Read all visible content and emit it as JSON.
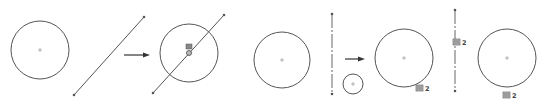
{
  "diagram": {
    "colors": {
      "stroke": "#555555",
      "background": "#ffffff",
      "arrow": "#333333",
      "icon": "#666666"
    },
    "panels": [
      {
        "id": "left-before",
        "elements": [
          {
            "type": "circle",
            "cx": 40,
            "cy": 50,
            "r": 29
          },
          {
            "type": "line",
            "x1": 74,
            "y1": 95,
            "x2": 144,
            "y2": 17
          }
        ]
      },
      {
        "id": "left-after",
        "elements": [
          {
            "type": "circle",
            "cx": 189,
            "cy": 53,
            "r": 29
          },
          {
            "type": "line",
            "x1": 153,
            "y1": 93,
            "x2": 224,
            "y2": 15
          },
          {
            "type": "relation-icon",
            "x": 186,
            "y": 44,
            "label": "coincident"
          }
        ]
      },
      {
        "id": "right-before",
        "elements": [
          {
            "type": "circle",
            "cx": 282,
            "cy": 60,
            "r": 28
          },
          {
            "type": "centerline",
            "x1": 332,
            "y1": 14,
            "x2": 332,
            "y2": 94
          },
          {
            "type": "circle",
            "cx": 353,
            "cy": 84,
            "r": 10
          }
        ]
      },
      {
        "id": "right-after",
        "elements": [
          {
            "type": "circle",
            "cx": 404,
            "cy": 58,
            "r": 29
          },
          {
            "type": "centerline",
            "x1": 455,
            "y1": 10,
            "x2": 455,
            "y2": 91
          },
          {
            "type": "circle",
            "cx": 507,
            "cy": 58,
            "r": 29
          }
        ]
      }
    ],
    "arrows": [
      {
        "x1": 124,
        "y1": 55,
        "x2": 150,
        "y2": 55
      },
      {
        "x1": 345,
        "y1": 59,
        "x2": 365,
        "y2": 59
      }
    ],
    "labels": [
      {
        "text": "2",
        "x": 425,
        "y": 91
      },
      {
        "text": "2",
        "x": 462,
        "y": 45
      },
      {
        "text": "2",
        "x": 512,
        "y": 98
      }
    ]
  }
}
